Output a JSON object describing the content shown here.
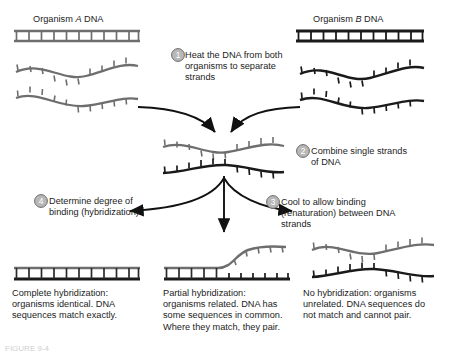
{
  "figure": {
    "title_organism_a": "Organism A DNA",
    "title_organism_b": "Organism B DNA",
    "organism_a_italic": "A",
    "organism_b_italic": "B",
    "label_a_prefix": "Organism ",
    "label_a_suffix": " DNA",
    "label_b_prefix": "Organism ",
    "label_b_suffix": " DNA",
    "figure_caption": "FIGURE 9-4"
  },
  "steps": [
    {
      "number": "1",
      "text": "Heat the DNA from both organisms to separate strands"
    },
    {
      "number": "2",
      "text": "Combine single strands of DNA"
    },
    {
      "number": "3",
      "text": "Cool to allow binding (renaturation) between DNA strands"
    },
    {
      "number": "4",
      "text": "Determine degree of binding (hybridization)"
    }
  ],
  "outcomes": [
    {
      "name": "complete",
      "text": "Complete hybridization: organisms identical. DNA sequences match exactly."
    },
    {
      "name": "partial",
      "text": "Partial hybridization: organisms related. DNA has some sequences in common.  Where they match, they pair."
    },
    {
      "name": "none",
      "text": "No hybridization: organisms unrelated. DNA sequences do not match and cannot pair."
    }
  ],
  "colors": {
    "strand_a": "#6e6e6e",
    "strand_b": "#1a1a1a",
    "arrow": "#111111",
    "step_circle_fill": "#b8b8b8",
    "step_circle_stroke": "#6a6a6a",
    "background": "#ffffff",
    "text": "#1c1c1c"
  },
  "diagram": {
    "type": "process-flow",
    "strand_count_per_organism": 2,
    "ladder_rungs": 10
  }
}
